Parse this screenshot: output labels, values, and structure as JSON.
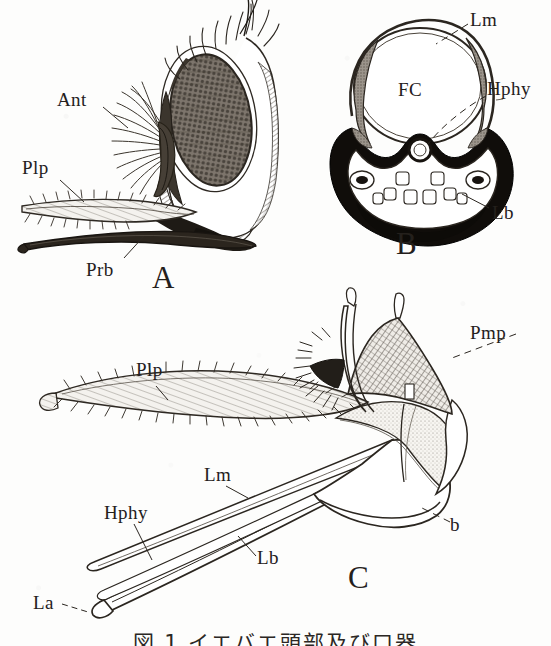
{
  "figure": {
    "kind": "scanned-scientific-plate",
    "background_color": "#fdfdfc",
    "ink_color": "#24201c",
    "caption": "図 1 イエバエ頭部及び口器"
  },
  "panels": [
    {
      "id": "A",
      "letter": "A",
      "title": "lateral view of head"
    },
    {
      "id": "B",
      "letter": "B",
      "title": "cross-section of proboscis"
    },
    {
      "id": "C",
      "letter": "C",
      "title": "dissected mouthparts"
    }
  ],
  "labels": {
    "panel_a": [
      {
        "key": "ant",
        "text": "Ant",
        "meaning": "antenna",
        "x": 57,
        "y": 90
      },
      {
        "key": "plp",
        "text": "Plp",
        "meaning": "palpus",
        "x": 22,
        "y": 158
      },
      {
        "key": "prb",
        "text": "Prb",
        "meaning": "proboscis",
        "x": 86,
        "y": 260
      },
      {
        "key": "letter_a",
        "text": "A",
        "meaning": "panel letter A",
        "x": 152,
        "y": 262
      }
    ],
    "panel_b": [
      {
        "key": "lm",
        "text": "Lm",
        "meaning": "labrum",
        "x": 470,
        "y": 10
      },
      {
        "key": "fc",
        "text": "FC",
        "meaning": "food canal",
        "x": 398,
        "y": 80
      },
      {
        "key": "hphy",
        "text": "Hphy",
        "meaning": "hypopharynx",
        "x": 487,
        "y": 79
      },
      {
        "key": "lb",
        "text": "Lb",
        "meaning": "labium",
        "x": 492,
        "y": 203
      },
      {
        "key": "letter_b",
        "text": "B",
        "meaning": "panel letter B",
        "x": 396,
        "y": 228
      }
    ],
    "panel_c": [
      {
        "key": "plp",
        "text": "Plp",
        "meaning": "palpus",
        "x": 136,
        "y": 360
      },
      {
        "key": "pmp",
        "text": "Pmp",
        "meaning": "maxillary palp",
        "x": 470,
        "y": 323
      },
      {
        "key": "lm",
        "text": "Lm",
        "meaning": "labrum",
        "x": 204,
        "y": 465
      },
      {
        "key": "hphy",
        "text": "Hphy",
        "meaning": "hypopharynx",
        "x": 104,
        "y": 503
      },
      {
        "key": "lb",
        "text": "Lb",
        "meaning": "labium",
        "x": 257,
        "y": 548
      },
      {
        "key": "la",
        "text": "La",
        "meaning": "labella",
        "x": 33,
        "y": 593
      },
      {
        "key": "b",
        "text": "b",
        "meaning": "basal sclerite",
        "x": 450,
        "y": 515
      },
      {
        "key": "letter_c",
        "text": "C",
        "meaning": "panel letter C",
        "x": 348,
        "y": 562
      }
    ]
  }
}
